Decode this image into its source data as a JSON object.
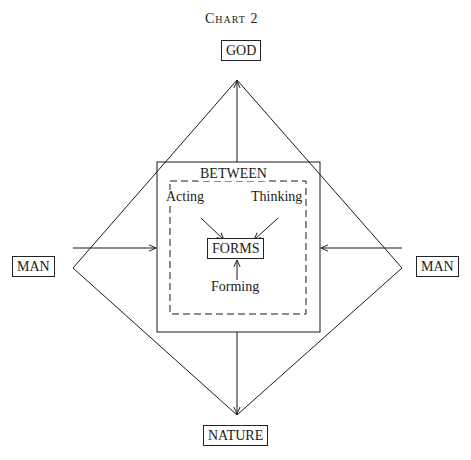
{
  "diagram": {
    "caption": "Chart 2",
    "nodes": {
      "top": "GOD",
      "left": "MAN",
      "right": "MAN",
      "bottom": "NATURE",
      "center": "FORMS"
    },
    "frame_title": "BETWEEN",
    "inner_labels": {
      "acting": "Acting",
      "thinking": "Thinking",
      "forming": "Forming"
    },
    "edges": [
      {
        "from": "diamond-center",
        "to": "GOD",
        "arrow": "up"
      },
      {
        "from": "diamond-center",
        "to": "NATURE",
        "arrow": "down"
      },
      {
        "from": "MAN-left",
        "to": "BETWEEN",
        "arrow": "right"
      },
      {
        "from": "MAN-right",
        "to": "BETWEEN",
        "arrow": "left"
      },
      {
        "from": "Acting",
        "to": "FORMS"
      },
      {
        "from": "Thinking",
        "to": "FORMS"
      },
      {
        "from": "Forming",
        "to": "FORMS"
      }
    ],
    "colors": {
      "ink": "#1a1a1a",
      "background": "#ffffff"
    }
  }
}
